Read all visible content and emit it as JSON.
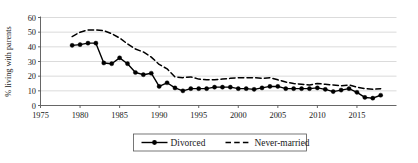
{
  "chart_data": {
    "type": "line",
    "title": "",
    "subtitle": "",
    "xlabel": "",
    "ylabel": "% living with parents",
    "xlim": [
      1975,
      2020
    ],
    "ylim": [
      0,
      60
    ],
    "xticks": [
      1975,
      1980,
      1985,
      1990,
      1995,
      2000,
      2005,
      2010,
      2015
    ],
    "yticks": [
      0,
      10,
      20,
      30,
      40,
      50,
      60
    ],
    "grid": "horizontal",
    "legend_position": "bottom-center",
    "x": [
      1979,
      1980,
      1981,
      1982,
      1983,
      1984,
      1985,
      1986,
      1987,
      1988,
      1989,
      1990,
      1991,
      1992,
      1993,
      1994,
      1995,
      1996,
      1997,
      1998,
      1999,
      2000,
      2001,
      2002,
      2003,
      2004,
      2005,
      2006,
      2007,
      2008,
      2009,
      2010,
      2011,
      2012,
      2013,
      2014,
      2015,
      2016,
      2017,
      2018
    ],
    "series": [
      {
        "name": "Divorced",
        "color": "#000000",
        "style": "solid",
        "marker": "circle",
        "values": [
          41,
          41.5,
          42.5,
          42.5,
          29,
          28.5,
          32.5,
          28.5,
          22.5,
          21,
          22,
          13,
          15.5,
          12,
          10,
          11.5,
          11.5,
          11.5,
          12.5,
          12.5,
          12.5,
          11.5,
          11.5,
          11,
          12,
          13,
          13,
          11.5,
          11.5,
          11.5,
          11.5,
          12,
          11,
          9.5,
          10.5,
          11.5,
          9,
          5.5,
          5,
          7
        ]
      },
      {
        "name": "Never-married",
        "color": "#000000",
        "style": "dashed",
        "marker": "none",
        "values": [
          47,
          50,
          51.5,
          51.5,
          51,
          49,
          46,
          42,
          38.5,
          36.5,
          33,
          28,
          25,
          19.5,
          19,
          19.5,
          18,
          17.5,
          17.5,
          18,
          18.5,
          19,
          19,
          19,
          18.5,
          19,
          17.5,
          16,
          15,
          14.5,
          14,
          15,
          14.5,
          14,
          13.5,
          14,
          12.5,
          11.5,
          11,
          11.5
        ]
      }
    ],
    "legend": [
      {
        "label": "Divorced",
        "style": "solid",
        "marker": "circle"
      },
      {
        "label": "Never-married",
        "style": "dashed",
        "marker": "none"
      }
    ]
  },
  "colors": {
    "ink": "#1a1a1a",
    "line": "#000000",
    "grid": "#cccccc",
    "axis": "#555555",
    "background": "#ffffff"
  }
}
